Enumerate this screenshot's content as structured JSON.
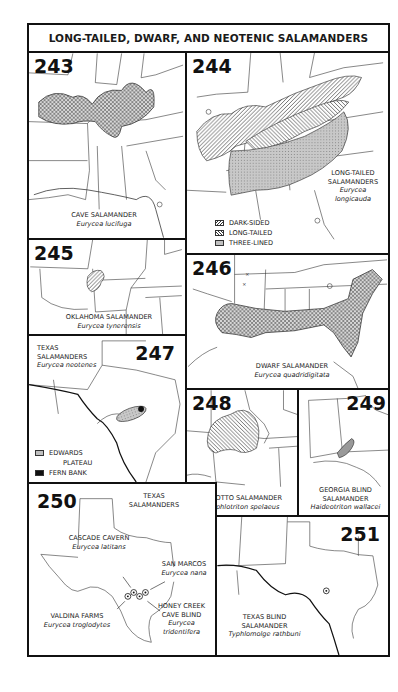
{
  "page": {
    "title": "LONG-TAILED, DWARF, AND NEOTENIC SALAMANDERS"
  },
  "maps": [
    {
      "number": "243",
      "common_name": "CAVE SALAMANDER",
      "scientific_name": "Eurycea lucifuga"
    },
    {
      "number": "244",
      "common_name_line1": "LONG-TAILED",
      "common_name_line2": "SALAMANDERS",
      "scientific_name_line1": "Eurycea",
      "scientific_name_line2": "longicauda",
      "legend": [
        {
          "label": "DARK-SIDED",
          "pattern": "diagonal-right"
        },
        {
          "label": "LONG-TAILED",
          "pattern": "diagonal-left"
        },
        {
          "label": "THREE-LINED",
          "pattern": "stipple-gray"
        }
      ]
    },
    {
      "number": "245",
      "common_name": "OKLAHOMA SALAMANDER",
      "scientific_name": "Eurycea tynerensis"
    },
    {
      "number": "246",
      "common_name": "DWARF SALAMANDER",
      "scientific_name": "Eurycea quadridigitata"
    },
    {
      "number": "247",
      "common_name_line1": "TEXAS",
      "common_name_line2": "SALAMANDERS",
      "scientific_name": "Eurycea neotenes",
      "legend": [
        {
          "label_line1": "EDWARDS",
          "label_line2": "PLATEAU",
          "pattern": "stipple-gray"
        },
        {
          "label": "FERN BANK",
          "pattern": "solid-black"
        }
      ]
    },
    {
      "number": "248",
      "common_name": "GROTTO SALAMANDER",
      "scientific_name": "Typhlotriton spelaeus"
    },
    {
      "number": "249",
      "common_name_line1": "GEORGIA BLIND",
      "common_name_line2": "SALAMANDER",
      "scientific_name": "Haideotriton wallacei"
    },
    {
      "number": "250",
      "title_line1": "TEXAS",
      "title_line2": "SALAMANDERS",
      "locations": [
        {
          "common_name": "CASCADE CAVERN",
          "scientific_name": "Eurycea latitans"
        },
        {
          "common_name": "SAN MARCOS",
          "scientific_name": "Eurycea nana"
        },
        {
          "common_name": "VALDINA FARMS",
          "scientific_name": "Eurycea troglodytes"
        },
        {
          "common_name_line1": "HONEY CREEK",
          "common_name_line2": "CAVE BLIND",
          "scientific_name_line1": "Eurycea",
          "scientific_name_line2": "tridentifera"
        }
      ]
    },
    {
      "number": "251",
      "common_name_line1": "TEXAS BLIND",
      "common_name_line2": "SALAMANDER",
      "scientific_name": "Typhlomolge rathbuni"
    }
  ],
  "colors": {
    "ink": "#111111",
    "stipple": "#9a9a9a",
    "paper": "#ffffff"
  }
}
